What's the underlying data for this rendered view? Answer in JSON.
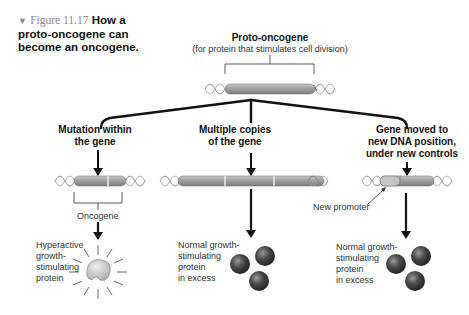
{
  "figure": {
    "marker": "▼",
    "number": "Figure 11.17",
    "title_line1": "How a",
    "title_line2": "proto-oncogene can",
    "title_line3": "become an oncogene."
  },
  "top": {
    "title": "Proto-oncogene",
    "subtitle": "(for protein that stimulates cell division)",
    "dna_label": "DNA"
  },
  "branches": [
    {
      "heading_line1": "Mutation within",
      "heading_line2": "the gene",
      "gene_label": "Oncogene",
      "result_lines": [
        "Hyperactive",
        "growth-",
        "stimulating",
        "protein"
      ]
    },
    {
      "heading_line1": "Multiple copies",
      "heading_line2": "of the gene",
      "result_lines": [
        "Normal growth-",
        "stimulating",
        "protein",
        "in excess"
      ]
    },
    {
      "heading_line1": "Gene moved to",
      "heading_line2": "new DNA position,",
      "heading_line3": "under new controls",
      "promoter_label": "New promoter",
      "result_lines": [
        "Normal growth-",
        "stimulating",
        "protein",
        "in excess"
      ]
    }
  ],
  "colors": {
    "gene_fill": "#9a9a9a",
    "gene_highlight": "#d0d0d0",
    "protein_sphere": "#3a3a3a",
    "dna_strand": "#777777",
    "arrow": "#111111"
  }
}
